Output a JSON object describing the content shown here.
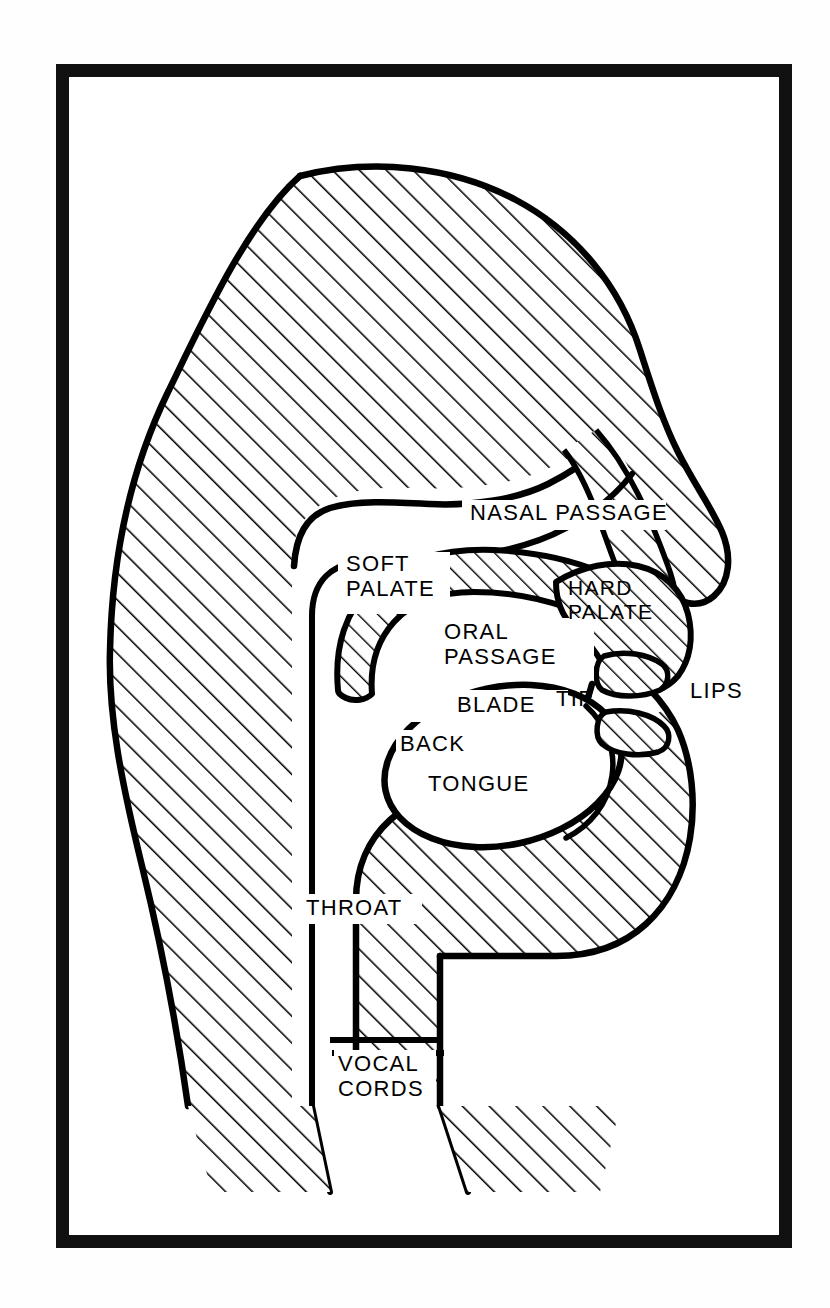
{
  "figure": {
    "type": "anatomical-line-diagram",
    "style": "black and white hatched line drawing, side profile of a head facing right",
    "border_color": "#111111",
    "ink_color": "#000000",
    "background_color": "#ffffff"
  },
  "labels": [
    {
      "id": "nasal-passage",
      "text": "NASAL PASSAGE",
      "lines": [
        "NASAL PASSAGE"
      ],
      "x": 470,
      "y": 512
    },
    {
      "id": "soft-palate",
      "text": "SOFT PALATE",
      "lines": [
        "SOFT",
        "PALATE"
      ],
      "x": 346,
      "y": 560
    },
    {
      "id": "hard-palate",
      "text": "HARD PALATE",
      "lines": [
        "HARD",
        "PALATE"
      ],
      "x": 566,
      "y": 582
    },
    {
      "id": "oral-passage",
      "text": "ORAL PASSAGE",
      "lines": [
        "ORAL",
        "PASSAGE"
      ],
      "x": 444,
      "y": 626
    },
    {
      "id": "lips",
      "text": "LIPS",
      "lines": [
        "LIPS"
      ],
      "x": 688,
      "y": 684
    },
    {
      "id": "blade",
      "text": "BLADE",
      "lines": [
        "BLADE"
      ],
      "x": 457,
      "y": 703
    },
    {
      "id": "tip",
      "text": "TIP",
      "lines": [
        "TIP"
      ],
      "x": 553,
      "y": 698
    },
    {
      "id": "back",
      "text": "BACK",
      "lines": [
        "BACK"
      ],
      "x": 404,
      "y": 743
    },
    {
      "id": "tongue",
      "text": "TONGUE",
      "lines": [
        "TONGUE"
      ],
      "x": 431,
      "y": 781
    },
    {
      "id": "throat",
      "text": "THROAT",
      "lines": [
        "THROAT"
      ],
      "x": 308,
      "y": 903
    },
    {
      "id": "vocal-cords",
      "text": "VOCAL CORDS",
      "lines": [
        "VOCAL",
        "CORDS"
      ],
      "x": 340,
      "y": 1057
    }
  ],
  "label_text": {
    "nasal_passage": "NASAL PASSAGE",
    "soft_palate_1": "SOFT",
    "soft_palate_2": "PALATE",
    "hard_palate_1": "HARD",
    "hard_palate_2": "PALATE",
    "oral_passage_1": "ORAL",
    "oral_passage_2": "PASSAGE",
    "lips": "LIPS",
    "blade": "BLADE",
    "tip": "TIP",
    "back": "BACK",
    "tongue": "TONGUE",
    "throat": "THROAT",
    "vocal_cords_1": "VOCAL",
    "vocal_cords_2": "CORDS"
  },
  "bleed_through": {
    "top_left": "",
    "top_right": "",
    "bottom_left": "",
    "bottom_right": ""
  },
  "regions": [
    {
      "id": "skull-and-face",
      "label": "hatched head/skull mass",
      "hatched": true
    },
    {
      "id": "nasal-passage-cavity",
      "label": "nasal passage (white channel)",
      "hatched": false
    },
    {
      "id": "soft-palate-body",
      "label": "soft palate / velum",
      "hatched": true
    },
    {
      "id": "hard-palate-body",
      "label": "hard palate",
      "hatched": true
    },
    {
      "id": "oral-passage-cavity",
      "label": "oral passage (white cavity)",
      "hatched": false
    },
    {
      "id": "tongue-body",
      "label": "tongue (white lobe)",
      "hatched": false
    },
    {
      "id": "upper-lip",
      "label": "upper lip",
      "hatched": true
    },
    {
      "id": "lower-lip",
      "label": "lower lip",
      "hatched": true
    },
    {
      "id": "jaw-and-chin",
      "label": "jaw and chin mass",
      "hatched": true
    },
    {
      "id": "throat-channel",
      "label": "throat / pharynx (white vertical channel)",
      "hatched": false
    },
    {
      "id": "vocal-cords-lines",
      "label": "two horizontal vocal cord lines",
      "hatched": false
    },
    {
      "id": "neck-back",
      "label": "back of neck",
      "hatched": true
    }
  ]
}
